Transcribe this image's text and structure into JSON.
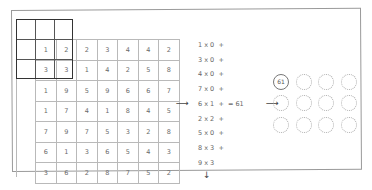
{
  "diagram": {
    "input_grid": [
      [
        "1",
        "2",
        "2",
        "3",
        "4",
        "4",
        "2"
      ],
      [
        "3",
        "3",
        "1",
        "4",
        "2",
        "5",
        "8"
      ],
      [
        "1",
        "9",
        "5",
        "9",
        "6",
        "6",
        "7"
      ],
      [
        "1",
        "7",
        "4",
        "1",
        "8",
        "4",
        "5"
      ],
      [
        "7",
        "9",
        "7",
        "5",
        "3",
        "2",
        "8"
      ],
      [
        "6",
        "1",
        "3",
        "6",
        "5",
        "4",
        "3"
      ],
      [
        "3",
        "6",
        "2",
        "8",
        "7",
        "5",
        "2"
      ]
    ],
    "equations": [
      "1 x 0  +",
      "3 x 0  +",
      "4 x 0  +",
      "7 x 0  +",
      "6 x 1  +  = 61",
      "2 x 2  +",
      "5 x 0  +",
      "8 x 3  +",
      "9 x 3"
    ],
    "result_value": "61",
    "output_grid": {
      "rows": 3,
      "cols": 4,
      "filled": [
        [
          "61",
          "",
          "",
          ""
        ],
        [
          "",
          "",
          "",
          ""
        ],
        [
          "",
          "",
          "",
          ""
        ]
      ]
    },
    "arrows": {
      "grid_to_equations": "⟶",
      "equations_to_output": "⟶",
      "down": "↓"
    }
  }
}
